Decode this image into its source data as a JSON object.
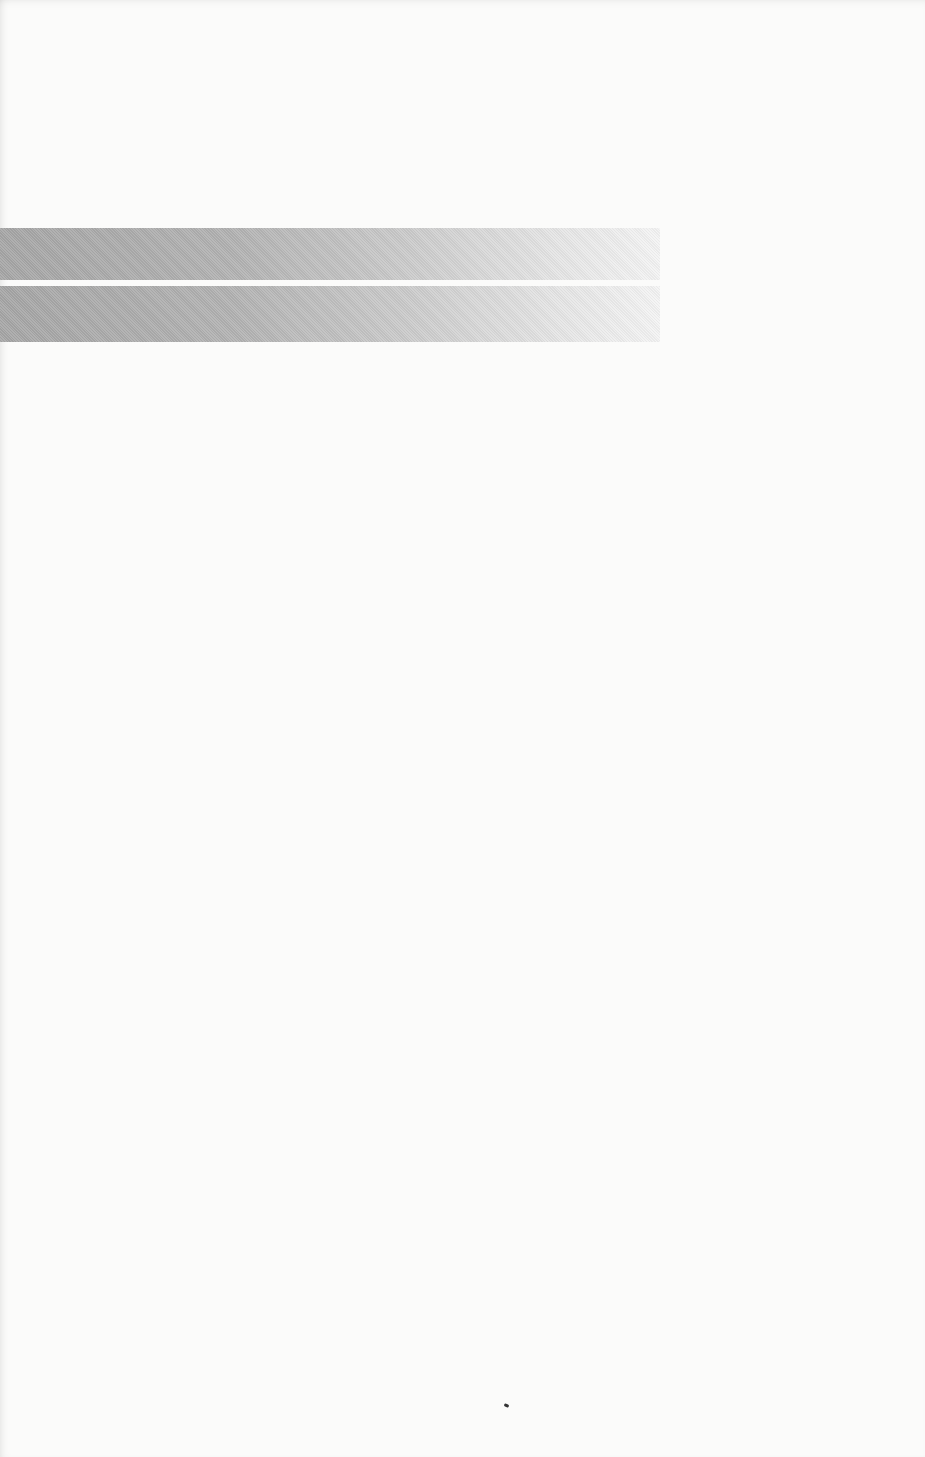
{
  "page": {
    "type": "scanned-blank-page",
    "background_color": "#fbfbfa"
  },
  "decorations": {
    "bars": [
      {
        "name": "gradient-bar-top",
        "color_start": "#a6a6a6",
        "color_end": "#f4f4f4"
      },
      {
        "name": "gradient-bar-bottom",
        "color_start": "#a6a6a6",
        "color_end": "#f4f4f4"
      }
    ]
  }
}
